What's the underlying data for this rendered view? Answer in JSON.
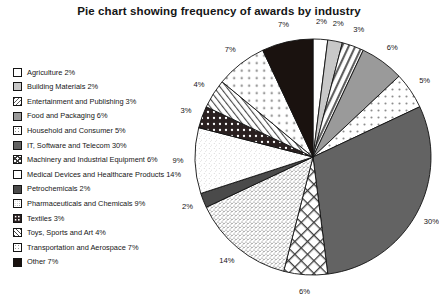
{
  "chart_data": {
    "type": "pie",
    "title": "Pie chart showing frequency of awards by industry",
    "xlabel": "",
    "ylabel": "",
    "legend_position": "left",
    "grid": false,
    "unit": "%",
    "start_angle_deg": 0,
    "direction": "clockwise",
    "categories": [
      "Agriculture",
      "Building Materials",
      "Entertainment and Publishing",
      "Food and Packaging",
      "Household and Consumer",
      "IT, Software and Telecom",
      "Machinery and Industrial Equipment",
      "Medical Devices and Healthcare Products",
      "Petrochemicals",
      "Pharmaceuticals and Chemicals",
      "Textiles",
      "Toys, Sports and Art",
      "Transportation and Aerospace",
      "Other"
    ],
    "values": [
      2,
      2,
      3,
      6,
      5,
      30,
      6,
      14,
      2,
      9,
      3,
      4,
      7,
      7
    ],
    "slices": [
      {
        "label": "Agriculture",
        "value": 2,
        "value_text": "2%",
        "legend_text": "Agriculture 2%",
        "pattern": "solid-white",
        "fill": "#ffffff"
      },
      {
        "label": "Building Materials",
        "value": 2,
        "value_text": "2%",
        "legend_text": "Building Materials 2%",
        "pattern": "solid-light-gray",
        "fill": "#c8c8c8"
      },
      {
        "label": "Entertainment and Publishing",
        "value": 3,
        "value_text": "3%",
        "legend_text": "Entertainment and Publishing 3%",
        "pattern": "diagonal-hatch",
        "fill": "#ffffff"
      },
      {
        "label": "Food and Packaging",
        "value": 6,
        "value_text": "6%",
        "legend_text": "Food and Packaging 6%",
        "pattern": "solid-mid-gray",
        "fill": "#9a9a9a"
      },
      {
        "label": "Household and Consumer",
        "value": 5,
        "value_text": "5%",
        "legend_text": "Household and Consumer 5%",
        "pattern": "sparse-dots",
        "fill": "#ffffff"
      },
      {
        "label": "IT, Software and Telecom",
        "value": 30,
        "value_text": "30%",
        "legend_text": "IT, Software and Telecom 30%",
        "pattern": "solid-dark-gray",
        "fill": "#636363"
      },
      {
        "label": "Machinery and Industrial Equipment",
        "value": 6,
        "value_text": "6%",
        "legend_text": "Machinery and Industrial Equipment 6%",
        "pattern": "cross-hatch",
        "fill": "#ffffff"
      },
      {
        "label": "Medical Devices and Healthcare Products",
        "value": 14,
        "value_text": "14%",
        "legend_text": "Medical Devices and Healthcare Products 14%",
        "pattern": "fine-speckle",
        "fill": "#ffffff"
      },
      {
        "label": "Petrochemicals",
        "value": 2,
        "value_text": "2%",
        "legend_text": "Petrochemicals 2%",
        "pattern": "solid-charcoal",
        "fill": "#4a4a4a"
      },
      {
        "label": "Pharmaceuticals and Chemicals",
        "value": 9,
        "value_text": "9%",
        "legend_text": "Pharmaceuticals and Chemicals 9%",
        "pattern": "light-noise",
        "fill": "#ffffff"
      },
      {
        "label": "Textiles",
        "value": 3,
        "value_text": "3%",
        "legend_text": "Textiles 3%",
        "pattern": "dark-polka",
        "fill": "#2a2020"
      },
      {
        "label": "Toys, Sports and Art",
        "value": 4,
        "value_text": "4%",
        "legend_text": "Toys, Sports and Art 4%",
        "pattern": "diagonal-lines",
        "fill": "#ffffff"
      },
      {
        "label": "Transportation and Aerospace",
        "value": 7,
        "value_text": "7%",
        "legend_text": "Transportation and Aerospace 7%",
        "pattern": "round-dots",
        "fill": "#ffffff"
      },
      {
        "label": "Other",
        "value": 7,
        "value_text": "7%",
        "legend_text": "Other 7%",
        "pattern": "solid-black",
        "fill": "#1a120f"
      }
    ]
  },
  "colors": {
    "background": "#ffffff",
    "text": "#161616",
    "outline": "#141414"
  }
}
